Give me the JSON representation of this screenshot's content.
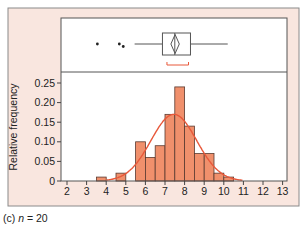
{
  "caption": {
    "label": "(c)",
    "variable": "n",
    "equals": "=",
    "value": "20"
  },
  "colors": {
    "panel_bg": "#f9e6df",
    "panel_border": "#8a8a8a",
    "plot_bg": "#ffffff",
    "bar_fill": "#f0906c",
    "bar_stroke": "#5a3a30",
    "curve": "#e8583a",
    "bracket": "#e8583a",
    "axis": "#444444"
  },
  "chart_data": {
    "type": "bar",
    "title": "",
    "xlabel": "",
    "ylabel": "Relative frequency",
    "xlim": [
      2,
      13
    ],
    "ylim": [
      0,
      0.25
    ],
    "x_ticks": [
      "2",
      "3",
      "4",
      "5",
      "6",
      "7",
      "8",
      "9",
      "10",
      "11",
      "12",
      "13"
    ],
    "y_ticks": [
      "0",
      "0.05",
      "0.10",
      "0.15",
      "0.20",
      "0.25"
    ],
    "grid": false,
    "bin_width": 0.5,
    "bins": [
      {
        "start": 3.5,
        "end": 4.0,
        "value": 0.01
      },
      {
        "start": 4.5,
        "end": 5.0,
        "value": 0.02
      },
      {
        "start": 5.5,
        "end": 6.0,
        "value": 0.1
      },
      {
        "start": 6.0,
        "end": 6.5,
        "value": 0.06
      },
      {
        "start": 6.5,
        "end": 7.0,
        "value": 0.09
      },
      {
        "start": 7.0,
        "end": 7.5,
        "value": 0.17
      },
      {
        "start": 7.5,
        "end": 8.0,
        "value": 0.24
      },
      {
        "start": 8.0,
        "end": 8.5,
        "value": 0.14
      },
      {
        "start": 8.5,
        "end": 9.0,
        "value": 0.07
      },
      {
        "start": 9.0,
        "end": 9.5,
        "value": 0.07
      },
      {
        "start": 9.5,
        "end": 10.0,
        "value": 0.02
      },
      {
        "start": 10.0,
        "end": 10.5,
        "value": 0.01
      }
    ],
    "fitted_curve": {
      "type": "normal",
      "mean": 7.45,
      "sd": 1.17,
      "peak": 0.17
    },
    "boxplot": {
      "outliers": [
        3.55,
        4.67,
        4.87
      ],
      "whisker_low": 5.45,
      "q1": 6.87,
      "median": 7.5,
      "q3": 8.3,
      "whisker_high": 10.2,
      "mean_diamond": [
        7.3,
        7.73
      ],
      "shortest_half_bracket": [
        7.1,
        8.2
      ]
    }
  }
}
